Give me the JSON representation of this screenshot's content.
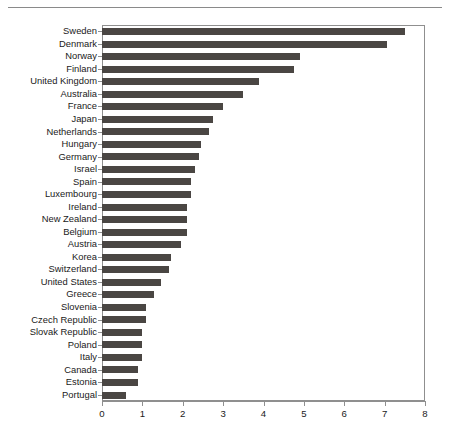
{
  "chart_data": {
    "type": "bar",
    "orientation": "horizontal",
    "title": "",
    "subtitle": "",
    "xlabel": "",
    "ylabel": "",
    "xlim": [
      0,
      8
    ],
    "ylim": null,
    "grid": false,
    "legend": null,
    "bar_color": "#4a4643",
    "axis_color": "#8f8f8f",
    "background": "#ffffff",
    "xticks": [
      0,
      1,
      2,
      3,
      4,
      5,
      6,
      7,
      8
    ],
    "xticklabels": [
      "0",
      "1",
      "2",
      "3",
      "4",
      "5",
      "6",
      "7",
      "8"
    ],
    "categories": [
      "Sweden",
      "Denmark",
      "Norway",
      "Finland",
      "United Kingdom",
      "Australia",
      "France",
      "Japan",
      "Netherlands",
      "Hungary",
      "Germany",
      "Israel",
      "Spain",
      "Luxembourg",
      "Ireland",
      "New Zealand",
      "Belgium",
      "Austria",
      "Korea",
      "Switzerland",
      "United States",
      "Greece",
      "Slovenia",
      "Czech Republic",
      "Slovak Republic",
      "Poland",
      "Italy",
      "Canada",
      "Estonia",
      "Portugal"
    ],
    "values": [
      7.5,
      7.05,
      4.9,
      4.75,
      3.9,
      3.5,
      3.0,
      2.75,
      2.65,
      2.45,
      2.4,
      2.3,
      2.2,
      2.2,
      2.1,
      2.1,
      2.1,
      1.95,
      1.7,
      1.65,
      1.45,
      1.3,
      1.1,
      1.1,
      1.0,
      1.0,
      1.0,
      0.9,
      0.9,
      0.6
    ]
  },
  "figure": {
    "top_rule": true
  }
}
